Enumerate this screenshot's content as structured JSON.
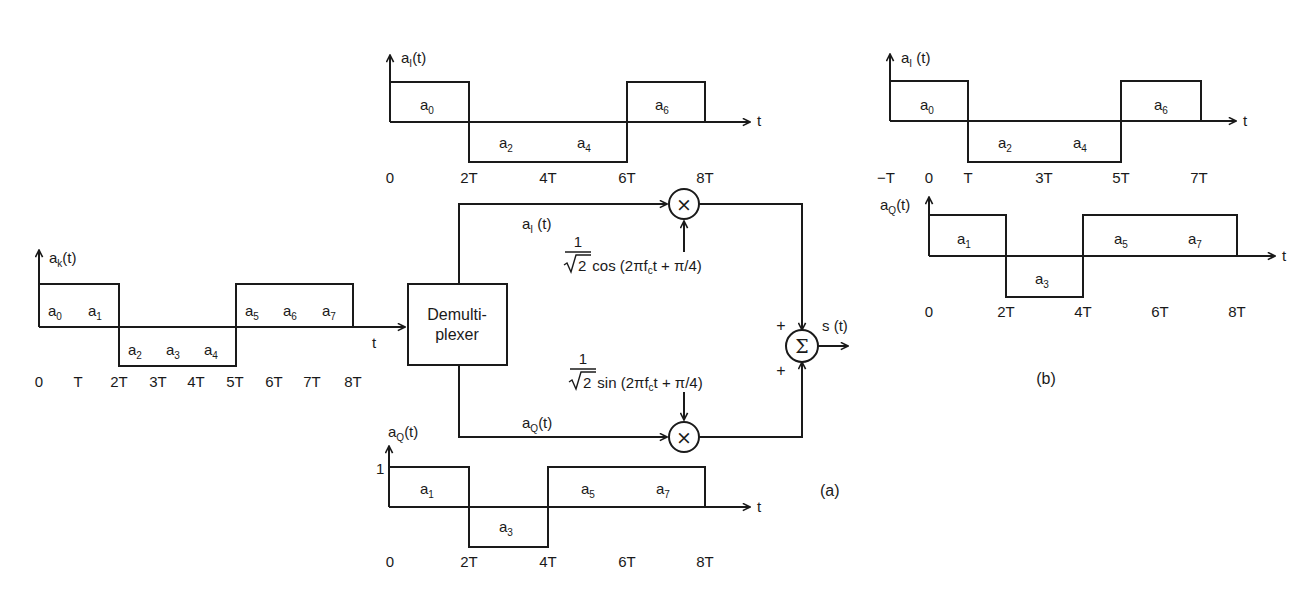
{
  "figure": {
    "labels": {
      "a": "(a)",
      "b": "(b)"
    }
  },
  "input_waveform": {
    "axis_label": "a",
    "axis_sub": "k",
    "axis_suffix": "(t)",
    "t_label": "t",
    "ticks": [
      "0",
      "T",
      "2T",
      "3T",
      "4T",
      "5T",
      "6T",
      "7T",
      "8T"
    ],
    "symbols": [
      {
        "base": "a",
        "sub": "0"
      },
      {
        "base": "a",
        "sub": "1"
      },
      {
        "base": "a",
        "sub": "2"
      },
      {
        "base": "a",
        "sub": "3"
      },
      {
        "base": "a",
        "sub": "4"
      },
      {
        "base": "a",
        "sub": "5"
      },
      {
        "base": "a",
        "sub": "6"
      },
      {
        "base": "a",
        "sub": "7"
      }
    ]
  },
  "top_I_waveform": {
    "axis_label": "a",
    "axis_sub": "I",
    "axis_suffix": "(t)",
    "t_label": "t",
    "ticks": [
      "0",
      "2T",
      "4T",
      "6T",
      "8T"
    ],
    "symbols": [
      {
        "base": "a",
        "sub": "0"
      },
      {
        "base": "a",
        "sub": "2"
      },
      {
        "base": "a",
        "sub": "4"
      },
      {
        "base": "a",
        "sub": "6"
      }
    ]
  },
  "bottom_Q_waveform": {
    "axis_label": "a",
    "axis_sub": "Q",
    "axis_suffix": "(t)",
    "level_label": "1",
    "t_label": "t",
    "ticks": [
      "0",
      "2T",
      "4T",
      "6T",
      "8T"
    ],
    "symbols": [
      {
        "base": "a",
        "sub": "1"
      },
      {
        "base": "a",
        "sub": "3"
      },
      {
        "base": "a",
        "sub": "5"
      },
      {
        "base": "a",
        "sub": "7"
      }
    ]
  },
  "block_diagram": {
    "demux_line1": "Demulti-",
    "demux_line2": "plexer",
    "i_branch": {
      "base": "a",
      "sub": "I",
      "suffix": " (t)"
    },
    "q_branch": {
      "base": "a",
      "sub": "Q",
      "suffix": "(t)"
    },
    "cos_carrier": {
      "num": "1",
      "den": "2",
      "func": "cos (2",
      "pi": "π",
      "f": "f",
      "fsub": "c",
      "rest": "t + π/4)"
    },
    "sin_carrier": {
      "num": "1",
      "den": "2",
      "func": "sin (2",
      "pi": "π",
      "f": "f",
      "fsub": "c",
      "rest": "t + π/4)"
    },
    "multiplier_symbol": "×",
    "summer_symbol": "Σ",
    "plus_top": "+",
    "plus_bottom": "+",
    "output_label": "s (t)"
  },
  "right_I_waveform": {
    "axis_label": "a",
    "axis_sub": "I",
    "axis_suffix": " (t)",
    "t_label": "t",
    "ticks": [
      "−T",
      "0",
      "T",
      "3T",
      "5T",
      "7T"
    ],
    "symbols": [
      {
        "base": "a",
        "sub": "0"
      },
      {
        "base": "a",
        "sub": "2"
      },
      {
        "base": "a",
        "sub": "4"
      },
      {
        "base": "a",
        "sub": "6"
      }
    ]
  },
  "right_Q_waveform": {
    "axis_label": "a",
    "axis_sub": "Q",
    "axis_suffix": "(t)",
    "t_label": "t",
    "ticks": [
      "0",
      "2T",
      "4T",
      "6T",
      "8T"
    ],
    "symbols": [
      {
        "base": "a",
        "sub": "1"
      },
      {
        "base": "a",
        "sub": "3"
      },
      {
        "base": "a",
        "sub": "5"
      },
      {
        "base": "a",
        "sub": "7"
      }
    ]
  }
}
